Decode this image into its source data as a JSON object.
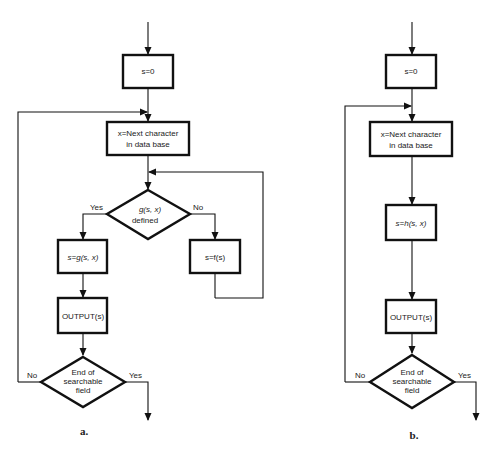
{
  "diagram_a": {
    "caption": "a.",
    "init": "s=0",
    "next_line1": "x=Next character",
    "next_line2": "in data base",
    "decision1_line1": "g(s, x)",
    "decision1_line2": "defined",
    "yes1": "Yes",
    "no1": "No",
    "goto": "s=g(s, x)",
    "failure": "s=f(s)",
    "output": "OUTPUT(s)",
    "decision2_line1": "End of",
    "decision2_line2": "searchable",
    "decision2_line3": "field",
    "no2": "No",
    "yes2": "Yes"
  },
  "diagram_b": {
    "caption": "b.",
    "init": "s=0",
    "next_line1": "x=Next character",
    "next_line2": "in data base",
    "transition": "s=h(s, x)",
    "output": "OUTPUT(s)",
    "decision_line1": "End of",
    "decision_line2": "searchable",
    "decision_line3": "field",
    "no": "No",
    "yes": "Yes"
  }
}
